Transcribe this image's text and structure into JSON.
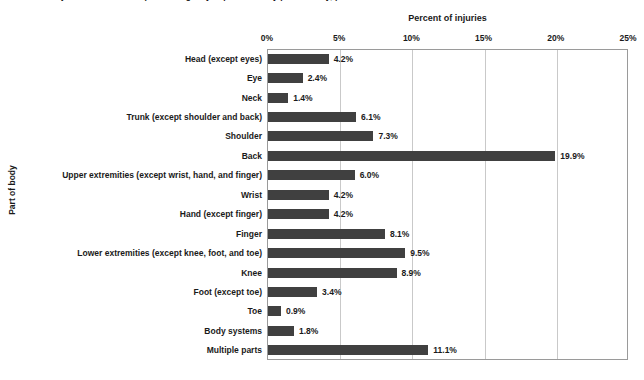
{
  "caption_cut_off": "Number of injuries treated in hospital emergency departments by part of body, percent distribution",
  "axis_titles": {
    "x": "Percent of injuries",
    "y": "Part of body"
  },
  "chart_data": {
    "type": "bar",
    "orientation": "horizontal",
    "title": "",
    "xlabel": "Percent of injuries",
    "ylabel": "Part of body",
    "xlim": [
      0,
      25
    ],
    "xticks": [
      "0%",
      "5%",
      "10%",
      "15%",
      "20%",
      "25%"
    ],
    "xtick_values": [
      0,
      5,
      10,
      15,
      20,
      25
    ],
    "grid": "vertical",
    "legend": "none",
    "bar_color": "#404040",
    "gridline_color": "#c9c9c9",
    "axis_color": "#9a9a9a",
    "categories": [
      "Head (except eyes)",
      "Eye",
      "Neck",
      "Trunk (except shoulder and back)",
      "Shoulder",
      "Back",
      "Upper extremities (except wrist, hand, and finger)",
      "Wrist",
      "Hand (except finger)",
      "Finger",
      "Lower extremities (except knee, foot, and toe)",
      "Knee",
      "Foot (except toe)",
      "Toe",
      "Body systems",
      "Multiple parts"
    ],
    "values": [
      4.2,
      2.4,
      1.4,
      6.1,
      7.3,
      19.9,
      6.0,
      4.2,
      4.2,
      8.1,
      9.5,
      8.9,
      3.4,
      0.9,
      1.8,
      11.1
    ],
    "labels": [
      "4.2%",
      "2.4%",
      "1.4%",
      "6.1%",
      "7.3%",
      "19.9%",
      "6.0%",
      "4.2%",
      "4.2%",
      "8.1%",
      "9.5%",
      "8.9%",
      "3.4%",
      "0.9%",
      "1.8%",
      "11.1%"
    ]
  }
}
